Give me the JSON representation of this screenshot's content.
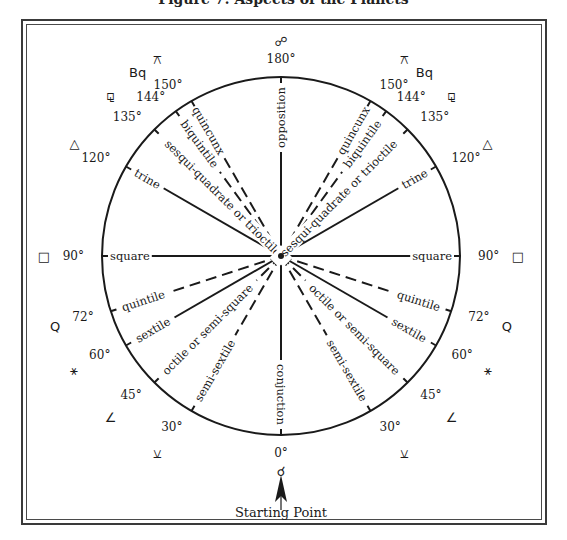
{
  "title": "Figure 7: Aspects of the Planets",
  "center": {
    "x": 281,
    "y": 256
  },
  "radius": 179,
  "colors": {
    "ink": "#1a1a1a",
    "frame": "#3a3a3a",
    "background": "#ffffff"
  },
  "top_symbol": "☍",
  "bottom_symbol": "☌",
  "starting_point": "Starting Point",
  "aspects": [
    {
      "angle": 0,
      "name": "conjuction",
      "style": "solid",
      "sides": "single",
      "degree_label": "0°",
      "symbol": "☌"
    },
    {
      "angle": 30,
      "name": "semi-sextile",
      "style": "dashed",
      "sides": "both",
      "degree_label": "30°",
      "symbol": "⚺"
    },
    {
      "angle": 45,
      "name": "octile or semi-square",
      "style": "dashed",
      "sides": "both",
      "degree_label": "45°",
      "symbol": "∠"
    },
    {
      "angle": 60,
      "name": "sextile",
      "style": "solid",
      "sides": "both",
      "degree_label": "60°",
      "symbol": "⚹"
    },
    {
      "angle": 72,
      "name": "quintile",
      "style": "dashed",
      "sides": "both",
      "degree_label": "72°",
      "symbol": "Q"
    },
    {
      "angle": 90,
      "name": "square",
      "style": "solid",
      "sides": "both",
      "degree_label": "90°",
      "symbol": "□"
    },
    {
      "angle": 120,
      "name": "trine",
      "style": "solid",
      "sides": "both",
      "degree_label": "120°",
      "symbol": "△"
    },
    {
      "angle": 135,
      "name": "sesqui-quadrate or trioctile",
      "style": "dashed",
      "sides": "both",
      "degree_label": "135°",
      "symbol": "⚼"
    },
    {
      "angle": 144,
      "name": "biquintile",
      "style": "dashed",
      "sides": "both",
      "degree_label": "144°",
      "symbol": "Bq"
    },
    {
      "angle": 150,
      "name": "quincunx",
      "style": "dashed",
      "sides": "both",
      "degree_label": "150°",
      "symbol": "⚻"
    },
    {
      "angle": 180,
      "name": "opposition",
      "style": "solid",
      "sides": "single",
      "degree_label": "180°",
      "symbol": "☍"
    }
  ]
}
